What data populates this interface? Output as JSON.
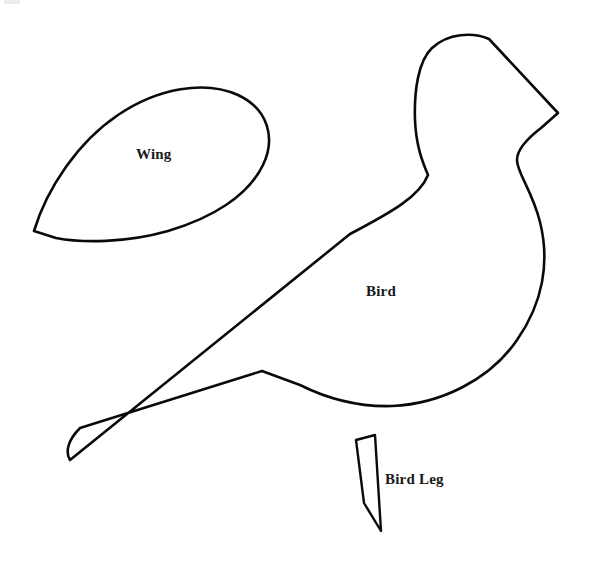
{
  "document": {
    "title": "Bird Sewing Pattern Template",
    "background_color": "#ffffff",
    "ink_color": "#0a0a0a",
    "label_color": "#1a1a1a",
    "width": 590,
    "height": 577
  },
  "pieces": [
    {
      "id": "wing",
      "label": "Wing",
      "shape": "teardrop",
      "label_position": {
        "x": 136,
        "y": 147
      },
      "outline_path": "M 34 231 C 47 188 78 142 118 115 C 158 88 205 80 238 95 C 268 109 276 138 263 165 C 248 196 212 218 168 231 C 126 243 82 243 56 238 Z"
    },
    {
      "id": "bird",
      "label": "Bird",
      "shape": "bird-body-with-tail",
      "label_position": {
        "x": 366,
        "y": 284
      },
      "outline_path": "M 558 113 L 489 39 C 473 32 448 33 432 48 C 418 61 414 92 415 120 C 416 145 422 161 428 175 C 420 196 392 212 350 234 L 70 460 C 65 452 68 440 80 428 L 262 371 L 300 385 C 330 400 360 407 392 406 C 440 404 490 380 517 340 C 543 303 550 262 540 222 C 532 190 517 173 517 160 C 517 150 528 138 541 128 Z"
    },
    {
      "id": "bird-leg",
      "label": "Bird Leg",
      "shape": "tapered-strip",
      "label_position": {
        "x": 385,
        "y": 472
      },
      "outline_path": "M 356 440 L 375 435 L 381 531 L 364 503 Z"
    }
  ],
  "artifacts": {
    "corner_smudge": {
      "x": 4,
      "y": 0,
      "width": 16,
      "height": 4,
      "color": "#e9e9e9"
    }
  },
  "chart_data": {
    "type": "table",
    "categories": [
      "Wing",
      "Bird",
      "Bird Leg"
    ],
    "values": [
      1,
      1,
      1
    ],
    "xlabel": "",
    "ylabel": ""
  }
}
